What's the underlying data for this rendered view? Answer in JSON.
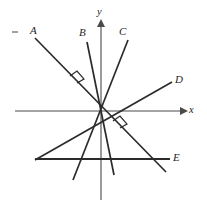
{
  "figure": {
    "width": 207,
    "height": 215,
    "background_color": "#ffffff",
    "line_color": "#2b2b2b",
    "axis_color": "#4a4a4a"
  },
  "axes": {
    "x_axis": {
      "label": "x",
      "y_pixel": 111,
      "x_start": 15,
      "x_end": 182,
      "arrow": "right"
    },
    "y_axis": {
      "label": "y",
      "x_pixel": 101,
      "y_start": 200,
      "y_end": 25,
      "arrow": "up"
    },
    "origin": {
      "x": 102,
      "y": 110
    }
  },
  "labels": {
    "a": "A",
    "b": "B",
    "c": "C",
    "d": "D",
    "e": "E",
    "x": "x",
    "y": "y"
  },
  "lines": [
    {
      "id": "A",
      "label": "A",
      "x1": 35,
      "y1": 38,
      "x2": 166,
      "y2": 172,
      "orientation": "descending",
      "label_x": 30,
      "label_y": 25
    },
    {
      "id": "B",
      "label": "B",
      "x1": 87,
      "y1": 42,
      "x2": 114,
      "y2": 175,
      "orientation": "steep-descending",
      "label_x": 79,
      "label_y": 27
    },
    {
      "id": "C",
      "label": "C",
      "x1": 128,
      "y1": 40,
      "x2": 73,
      "y2": 180,
      "orientation": "steep-descending-left",
      "label_x": 119,
      "label_y": 26
    },
    {
      "id": "D",
      "label": "D",
      "x1": 172,
      "y1": 82,
      "x2": 35,
      "y2": 160,
      "orientation": "ascending",
      "label_x": 175,
      "label_y": 74
    },
    {
      "id": "E",
      "label": "E",
      "x1": 35,
      "y1": 159,
      "x2": 170,
      "y2": 159,
      "orientation": "horizontal",
      "label_x": 173,
      "label_y": 152
    }
  ],
  "right_angles": [
    {
      "id": "upper-left",
      "x": 77,
      "y": 78,
      "between": [
        "A",
        "D"
      ]
    },
    {
      "id": "lower-right",
      "x": 120,
      "y": 123,
      "between": [
        "A",
        "C"
      ]
    }
  ],
  "tick_marks": [
    {
      "id": "top-left-tick",
      "x": 15,
      "y": 32
    }
  ]
}
